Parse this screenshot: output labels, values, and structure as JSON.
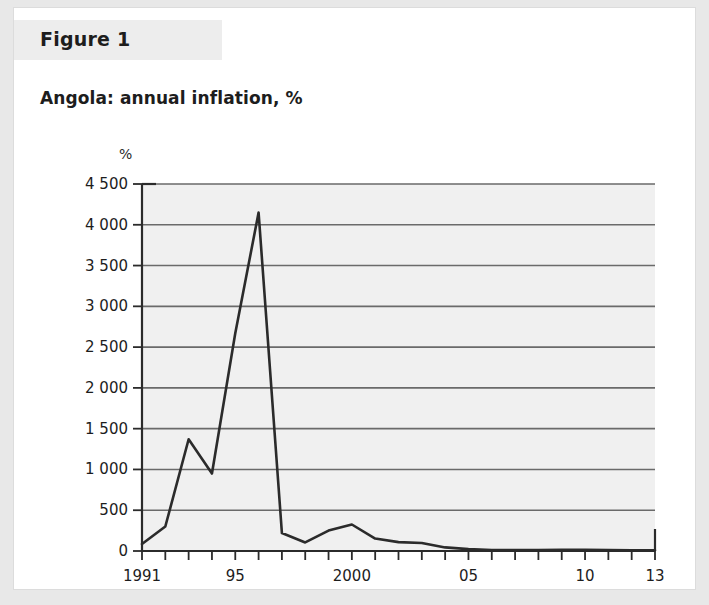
{
  "figure": {
    "label": "Figure 1"
  },
  "colors": {
    "page_background": "#e8e8e8",
    "card_background": "#ffffff",
    "band_background": "#ededed",
    "plot_background": "#f0f0f0",
    "gridline": "#6a6a6a",
    "axis": "#2b2b2b",
    "series_line": "#2b2b2b",
    "text": "#1d1d1d"
  },
  "chart_data": {
    "type": "line",
    "title": "Angola: annual inflation, %",
    "subtitle": "",
    "xlabel": "",
    "ylabel": "%",
    "unit_label": "%",
    "grid": true,
    "legend": false,
    "legend_position": "none",
    "xlim": [
      1991,
      2013
    ],
    "ylim": [
      0,
      4500
    ],
    "ytick_step": 500,
    "ytick_values": [
      0,
      500,
      1000,
      1500,
      2000,
      2500,
      3000,
      3500,
      4000,
      4500
    ],
    "ytick_labels": [
      "0",
      "500",
      "1 000",
      "1 500",
      "2 000",
      "2 500",
      "3 000",
      "3 500",
      "4 000",
      "4 500"
    ],
    "xtick_values": [
      1991,
      1992,
      1993,
      1994,
      1995,
      1996,
      1997,
      1998,
      1999,
      2000,
      2001,
      2002,
      2003,
      2004,
      2005,
      2006,
      2007,
      2008,
      2009,
      2010,
      2011,
      2012,
      2013
    ],
    "xtick_labeled": [
      {
        "x": 1991,
        "label": "1991"
      },
      {
        "x": 1995,
        "label": "95"
      },
      {
        "x": 2000,
        "label": "2000"
      },
      {
        "x": 2005,
        "label": "05"
      },
      {
        "x": 2010,
        "label": "10"
      },
      {
        "x": 2013,
        "label": "13"
      }
    ],
    "series": [
      {
        "name": "Angola annual inflation",
        "x": [
          1991,
          1992,
          1993,
          1994,
          1995,
          1996,
          1997,
          1998,
          1999,
          2000,
          2001,
          2002,
          2003,
          2004,
          2005,
          2006,
          2007,
          2008,
          2009,
          2010,
          2011,
          2012,
          2013
        ],
        "values": [
          85,
          300,
          1370,
          950,
          2670,
          4150,
          220,
          105,
          250,
          325,
          153,
          109,
          98,
          44,
          23,
          13,
          12,
          13,
          14,
          14,
          13,
          10,
          9
        ]
      }
    ],
    "annotations": []
  }
}
